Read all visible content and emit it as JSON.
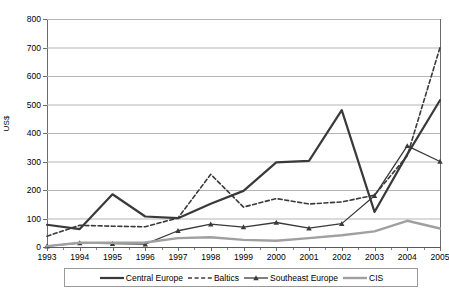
{
  "axes": {
    "ylabel": "US$",
    "yticks": [
      "0",
      "100",
      "200",
      "300",
      "400",
      "500",
      "600",
      "700",
      "800"
    ],
    "xticks": [
      "1993",
      "1994",
      "1995",
      "1996",
      "1997",
      "1998",
      "1999",
      "2000",
      "2001",
      "2002",
      "2003",
      "2004",
      "2005"
    ]
  },
  "legend": {
    "items": [
      {
        "label": "Central Europe",
        "style": "solid-dark",
        "color": "#3a3a3a"
      },
      {
        "label": "Baltics",
        "style": "dashed",
        "color": "#3a3a3a"
      },
      {
        "label": "Southeast Europe",
        "style": "solid-triangle",
        "color": "#3a3a3a"
      },
      {
        "label": "CIS",
        "style": "solid-gray",
        "color": "#a0a0a0"
      }
    ]
  },
  "chart_data": {
    "type": "line",
    "title": "",
    "xlabel": "",
    "ylabel": "US$",
    "x": [
      1993,
      1994,
      1995,
      1996,
      1997,
      1998,
      1999,
      2000,
      2001,
      2002,
      2003,
      2004,
      2005
    ],
    "categories": [
      "1993",
      "1994",
      "1995",
      "1996",
      "1997",
      "1998",
      "1999",
      "2000",
      "2001",
      "2002",
      "2003",
      "2004",
      "2005"
    ],
    "ylim": [
      0,
      800
    ],
    "xlim": [
      1993,
      2005
    ],
    "grid": true,
    "legend_position": "bottom",
    "series": [
      {
        "name": "Central Europe",
        "color": "#3a3a3a",
        "linestyle": "solid",
        "linewidth": 2.2,
        "marker": "none",
        "values": [
          78,
          63,
          185,
          107,
          101,
          152,
          197,
          297,
          302,
          480,
          123,
          325,
          515
        ]
      },
      {
        "name": "Baltics",
        "color": "#3a3a3a",
        "linestyle": "dashed",
        "linewidth": 1.6,
        "marker": "none",
        "values": [
          38,
          76,
          73,
          71,
          102,
          255,
          140,
          170,
          151,
          158,
          182,
          320,
          700
        ]
      },
      {
        "name": "Southeast Europe",
        "color": "#3a3a3a",
        "linestyle": "solid",
        "linewidth": 1.3,
        "marker": "triangle",
        "values": [
          3,
          14,
          12,
          10,
          57,
          80,
          70,
          86,
          66,
          82,
          180,
          355,
          300
        ]
      },
      {
        "name": "CIS",
        "color": "#a0a0a0",
        "linestyle": "solid",
        "linewidth": 2.4,
        "marker": "none",
        "values": [
          3,
          15,
          15,
          16,
          31,
          34,
          25,
          22,
          31,
          41,
          55,
          92,
          65
        ]
      }
    ]
  }
}
